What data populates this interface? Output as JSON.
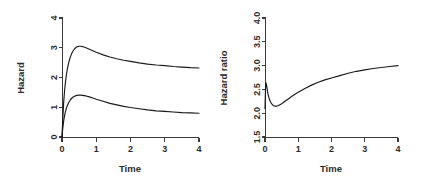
{
  "figure": {
    "background": "#ffffff",
    "axis_color": "#3a3a3a",
    "curve_color": "#1a1a1a",
    "panel_count": 2
  },
  "chart_data": [
    {
      "type": "line",
      "panel": "left",
      "title": "",
      "xlabel": "Time",
      "ylabel": "Hazard",
      "xlim": [
        0,
        4
      ],
      "ylim": [
        0,
        4
      ],
      "xticks": [
        0,
        1,
        2,
        3,
        4
      ],
      "xticklabels": [
        "0",
        "1",
        "2",
        "3",
        "4"
      ],
      "yticks": [
        0,
        1,
        2,
        3,
        4
      ],
      "yticklabels": [
        "0",
        "1",
        "2",
        "3",
        "4"
      ],
      "grid": false,
      "legend": "none",
      "series": [
        {
          "name": "upper hazard",
          "x": [
            0.0,
            0.02,
            0.05,
            0.08,
            0.12,
            0.16,
            0.2,
            0.25,
            0.3,
            0.35,
            0.4,
            0.45,
            0.5,
            0.55,
            0.6,
            0.7,
            0.8,
            0.9,
            1.0,
            1.2,
            1.4,
            1.6,
            1.8,
            2.0,
            2.25,
            2.5,
            2.75,
            3.0,
            3.25,
            3.5,
            3.75,
            4.0
          ],
          "y": [
            0.0,
            0.55,
            1.18,
            1.62,
            2.03,
            2.31,
            2.52,
            2.71,
            2.85,
            2.94,
            3.0,
            3.04,
            3.05,
            3.05,
            3.04,
            3.0,
            2.95,
            2.9,
            2.85,
            2.76,
            2.69,
            2.63,
            2.58,
            2.54,
            2.49,
            2.45,
            2.42,
            2.4,
            2.37,
            2.35,
            2.33,
            2.32
          ]
        },
        {
          "name": "lower hazard",
          "x": [
            0.0,
            0.02,
            0.05,
            0.08,
            0.12,
            0.16,
            0.2,
            0.25,
            0.3,
            0.35,
            0.4,
            0.45,
            0.5,
            0.55,
            0.6,
            0.7,
            0.8,
            0.9,
            1.0,
            1.2,
            1.4,
            1.6,
            1.8,
            2.0,
            2.25,
            2.5,
            2.75,
            3.0,
            3.25,
            3.5,
            3.75,
            4.0
          ],
          "y": [
            0.0,
            0.26,
            0.55,
            0.75,
            0.94,
            1.07,
            1.17,
            1.26,
            1.32,
            1.36,
            1.39,
            1.4,
            1.41,
            1.41,
            1.4,
            1.38,
            1.35,
            1.31,
            1.27,
            1.2,
            1.13,
            1.08,
            1.03,
            0.99,
            0.95,
            0.91,
            0.88,
            0.86,
            0.84,
            0.82,
            0.81,
            0.8
          ]
        }
      ]
    },
    {
      "type": "line",
      "panel": "right",
      "title": "",
      "xlabel": "Time",
      "ylabel": "Hazard ratio",
      "xlim": [
        0,
        4
      ],
      "ylim": [
        1.5,
        4.0
      ],
      "xticks": [
        0,
        1,
        2,
        3,
        4
      ],
      "xticklabels": [
        "0",
        "1",
        "2",
        "3",
        "4"
      ],
      "yticks": [
        1.5,
        2.0,
        2.5,
        3.0,
        3.5,
        4.0
      ],
      "yticklabels": [
        "1.5",
        "2.0",
        "2.5",
        "3.0",
        "3.5",
        "4.0"
      ],
      "grid": false,
      "legend": "none",
      "series": [
        {
          "name": "hazard ratio",
          "x": [
            0.0,
            0.015,
            0.03,
            0.05,
            0.07,
            0.1,
            0.13,
            0.17,
            0.21,
            0.25,
            0.3,
            0.35,
            0.4,
            0.45,
            0.5,
            0.6,
            0.7,
            0.8,
            0.9,
            1.0,
            1.2,
            1.4,
            1.6,
            1.8,
            2.0,
            2.25,
            2.5,
            2.75,
            3.0,
            3.25,
            3.5,
            3.75,
            4.0
          ],
          "y": [
            2.1,
            2.52,
            2.64,
            2.58,
            2.48,
            2.37,
            2.3,
            2.23,
            2.19,
            2.16,
            2.15,
            2.15,
            2.16,
            2.18,
            2.2,
            2.25,
            2.3,
            2.35,
            2.4,
            2.44,
            2.52,
            2.59,
            2.65,
            2.7,
            2.74,
            2.79,
            2.84,
            2.88,
            2.91,
            2.94,
            2.96,
            2.98,
            3.0
          ]
        }
      ]
    }
  ],
  "panels": {
    "left": {
      "ylabel": "Hazard",
      "xlabel": "Time",
      "xticklabels": [
        "0",
        "1",
        "2",
        "3",
        "4"
      ],
      "yticklabels": [
        "0",
        "1",
        "2",
        "3",
        "4"
      ]
    },
    "right": {
      "ylabel": "Hazard ratio",
      "xlabel": "Time",
      "xticklabels": [
        "0",
        "1",
        "2",
        "3",
        "4"
      ],
      "yticklabels": [
        "1.5",
        "2.0",
        "2.5",
        "3.0",
        "3.5",
        "4.0"
      ]
    }
  }
}
